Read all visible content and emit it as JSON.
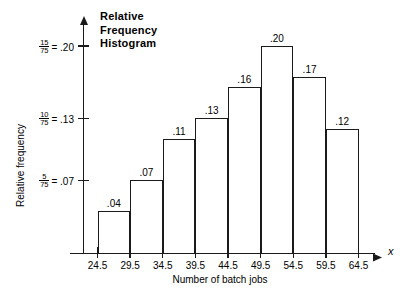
{
  "chart_data": {
    "type": "bar",
    "title": "Relative\nFrequency\nHistogram",
    "xlabel": "Number of batch jobs",
    "ylabel": "Relative frequency",
    "x_axis_variable": "x",
    "grid": false,
    "legend": null,
    "bin_edges": [
      24.5,
      29.5,
      34.5,
      39.5,
      44.5,
      49.5,
      54.5,
      59.5,
      64.5
    ],
    "categories": [
      "24.5-29.5",
      "29.5-34.5",
      "34.5-39.5",
      "39.5-44.5",
      "44.5-49.5",
      "49.5-54.5",
      "54.5-59.5",
      "59.5-64.5"
    ],
    "values": [
      0.04,
      0.07,
      0.11,
      0.13,
      0.16,
      0.2,
      0.17,
      0.12
    ],
    "bar_labels": [
      ".04",
      ".07",
      ".11",
      ".13",
      ".16",
      ".20",
      ".17",
      ".12"
    ],
    "xlim": [
      24.5,
      64.5
    ],
    "ylim": [
      0,
      0.225
    ],
    "x_tick_labels": [
      "24.5",
      "29.5",
      "34.5",
      "39.5",
      "44.5",
      "49.5",
      "54.5",
      "59.5",
      "64.5"
    ],
    "y_ticks": [
      {
        "value": 0.07,
        "numerator": "5",
        "denominator": "75",
        "equals": "= .07"
      },
      {
        "value": 0.13,
        "numerator": "10",
        "denominator": "75",
        "equals": "= .13"
      },
      {
        "value": 0.2,
        "numerator": "15",
        "denominator": "75",
        "equals": "= .20"
      }
    ]
  },
  "style": {
    "line_color": "#1a1a1a",
    "bar_fill": "#ffffff",
    "background": "#ffffff"
  }
}
